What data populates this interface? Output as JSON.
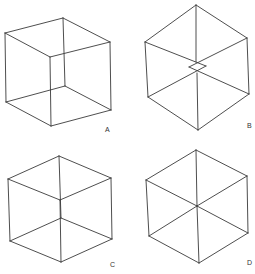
{
  "figure": {
    "panels": [
      {
        "label": "A",
        "description": "Necker cube wireframe, oblique view",
        "vertices": [
          [
            5,
            33
          ],
          [
            63,
            18
          ],
          [
            110,
            42
          ],
          [
            50,
            57
          ],
          [
            6,
            102
          ],
          [
            65,
            86
          ],
          [
            111,
            110
          ],
          [
            51,
            126
          ]
        ],
        "edges": [
          [
            0,
            1
          ],
          [
            1,
            2
          ],
          [
            2,
            3
          ],
          [
            3,
            0
          ],
          [
            4,
            5
          ],
          [
            5,
            6
          ],
          [
            6,
            7
          ],
          [
            7,
            4
          ],
          [
            0,
            4
          ],
          [
            1,
            5
          ],
          [
            2,
            6
          ],
          [
            3,
            7
          ]
        ],
        "label_pos": [
          105,
          132
        ]
      },
      {
        "label": "B",
        "description": "Cube viewed nearly along body diagonal, with small inner square",
        "vertices": [
          [
            196,
            5
          ],
          [
            145,
            42
          ],
          [
            247,
            38
          ],
          [
            148,
            97
          ],
          [
            249,
            94
          ],
          [
            198,
            130
          ],
          [
            196,
            62
          ],
          [
            189,
            67
          ],
          [
            206,
            66
          ],
          [
            197,
            73
          ]
        ],
        "edges": [
          [
            0,
            1
          ],
          [
            0,
            2
          ],
          [
            1,
            3
          ],
          [
            2,
            4
          ],
          [
            3,
            5
          ],
          [
            4,
            5
          ],
          [
            0,
            6
          ],
          [
            1,
            8
          ],
          [
            2,
            7
          ],
          [
            3,
            8
          ],
          [
            4,
            7
          ],
          [
            5,
            9
          ]
        ],
        "label_pos": [
          247,
          128
        ]
      },
      {
        "label": "C",
        "description": "Necker cube wireframe, hexagonal outline with offset inner vertices",
        "vertices": [
          [
            59,
            156
          ],
          [
            8,
            179
          ],
          [
            111,
            178
          ],
          [
            60,
            200
          ],
          [
            10,
            241
          ],
          [
            61,
            218
          ],
          [
            112,
            239
          ],
          [
            61,
            262
          ]
        ],
        "edges": [
          [
            0,
            1
          ],
          [
            0,
            2
          ],
          [
            1,
            3
          ],
          [
            2,
            3
          ],
          [
            0,
            5
          ],
          [
            1,
            4
          ],
          [
            2,
            6
          ],
          [
            3,
            7
          ],
          [
            4,
            5
          ],
          [
            5,
            6
          ],
          [
            4,
            7
          ],
          [
            6,
            7
          ]
        ],
        "label_pos": [
          110,
          267
        ]
      },
      {
        "label": "D",
        "description": "Cube viewed exactly along body diagonal; inner vertices coincide at center",
        "vertices": [
          [
            196,
            150
          ],
          [
            146,
            180
          ],
          [
            247,
            176
          ],
          [
            197,
            206
          ],
          [
            149,
            236
          ],
          [
            248,
            233
          ],
          [
            199,
            263
          ]
        ],
        "edges": [
          [
            0,
            1
          ],
          [
            0,
            2
          ],
          [
            1,
            3
          ],
          [
            2,
            3
          ],
          [
            1,
            4
          ],
          [
            2,
            5
          ],
          [
            4,
            3
          ],
          [
            5,
            3
          ],
          [
            4,
            6
          ],
          [
            5,
            6
          ],
          [
            0,
            3
          ],
          [
            3,
            6
          ]
        ],
        "label_pos": [
          247,
          265
        ]
      }
    ]
  }
}
